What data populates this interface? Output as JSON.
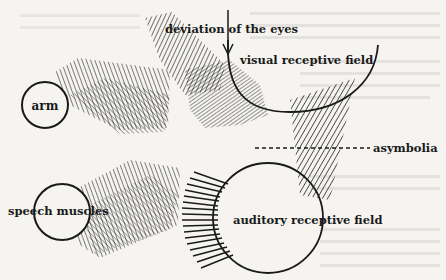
{
  "diagram": {
    "labels": {
      "deviation_of_eyes": "deviation of the eyes",
      "visual_field": "visual receptive field",
      "arm": "arm",
      "asymbolia": "asymbolia",
      "speech_muscles": "speech muscles",
      "auditory_field": "auditory receptive field"
    },
    "colors": {
      "ink": "#1a1a1a",
      "paper": "#f5f4f0",
      "bleed_through": "#c9c7c2"
    }
  }
}
